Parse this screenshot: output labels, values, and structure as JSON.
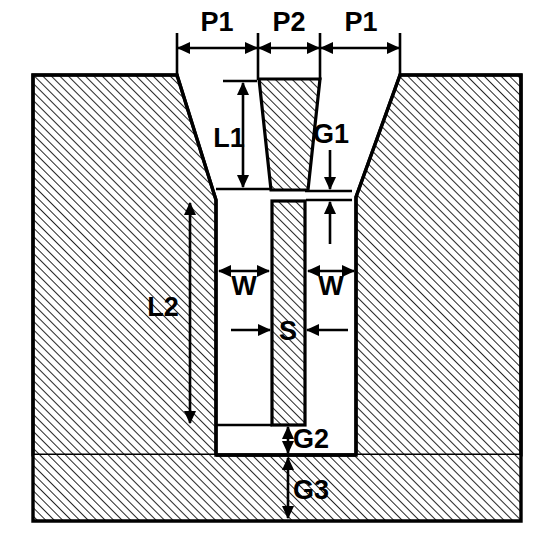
{
  "diagram": {
    "type": "engineering-cross-section",
    "colors": {
      "line": "#000000",
      "fill": "#ffffff",
      "hatch": "#000000",
      "background": "#ffffff"
    },
    "canvas": {
      "width": 554,
      "height": 538
    },
    "hatch": {
      "angle_deg": 45,
      "spacing_px": 6,
      "stroke_width": 1.6
    },
    "labels": [
      {
        "id": "P1L",
        "text": "P1",
        "x": 217,
        "y": 24,
        "orientation": "horizontal",
        "measures": "left pitch"
      },
      {
        "id": "P2",
        "text": "P2",
        "x": 289,
        "y": 24,
        "orientation": "horizontal",
        "measures": "center pitch"
      },
      {
        "id": "P1R",
        "text": "P1",
        "x": 361,
        "y": 24,
        "orientation": "horizontal",
        "measures": "right pitch"
      },
      {
        "id": "L1",
        "text": "L1",
        "x": 229,
        "y": 140,
        "orientation": "vertical",
        "measures": "taper length"
      },
      {
        "id": "G1",
        "text": "G1",
        "x": 331,
        "y": 136,
        "orientation": "vertical",
        "measures": "upper gap"
      },
      {
        "id": "L2",
        "text": "L2",
        "x": 163,
        "y": 309,
        "orientation": "vertical",
        "measures": "cavity depth"
      },
      {
        "id": "W_L",
        "text": "W",
        "x": 244,
        "y": 288,
        "orientation": "horizontal",
        "measures": "left gap width"
      },
      {
        "id": "W_R",
        "text": "W",
        "x": 331,
        "y": 288,
        "orientation": "horizontal",
        "measures": "right gap width"
      },
      {
        "id": "S",
        "text": "S",
        "x": 288,
        "y": 333,
        "orientation": "horizontal",
        "measures": "bar thickness"
      },
      {
        "id": "G2",
        "text": "G2",
        "x": 311,
        "y": 441,
        "orientation": "vertical",
        "measures": "bar-to-floor gap"
      },
      {
        "id": "G3",
        "text": "G3",
        "x": 311,
        "y": 492,
        "orientation": "vertical",
        "measures": "floor-to-base gap"
      }
    ],
    "geometry": {
      "outer_left": 33,
      "outer_right": 521,
      "outer_top": 75,
      "outer_bottom": 521,
      "left_block_top_right": 177,
      "left_block_wall_x": 216,
      "left_block_slope_bottom_y": 200,
      "right_block_top_left": 400,
      "right_block_wall_x": 356,
      "right_block_slope_bottom_y": 197,
      "cavity_bottom_y": 455,
      "post_top_left": 259,
      "post_top_right": 320,
      "post_bottom_left": 271,
      "post_bottom_right": 308,
      "post_top_y": 79,
      "post_bottom_y": 190,
      "bar_left": 272,
      "bar_right": 305,
      "bar_top": 201,
      "bar_bottom": 425
    },
    "dimension_lines": {
      "top_row_y": 48,
      "top_ticks_x": [
        177,
        258,
        320,
        400
      ],
      "top_tick_top_y": 33,
      "top_tick_bottom_y": 79,
      "L1_x": 243,
      "L1_top_y": 81,
      "L1_bottom_y": 189,
      "G1_x": 330,
      "G1_top_y": 150,
      "G1_bottom_y": 230,
      "L2_x": 190,
      "L2_top_y": 203,
      "L2_bottom_y": 423,
      "W_left_from": 217,
      "W_left_to": 271,
      "W_right_from": 306,
      "W_right_to": 355,
      "W_y": 271,
      "S_y": 330,
      "S_left_from": 230,
      "S_right_from": 348,
      "G2_x": 288,
      "G2_top_y": 425,
      "G2_bottom_y": 456,
      "G3_x": 288,
      "G3_top_y": 457,
      "G3_bottom_y": 519
    }
  }
}
